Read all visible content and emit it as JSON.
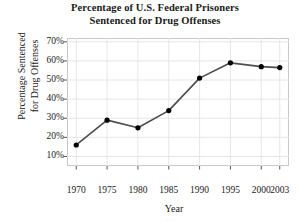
{
  "chart_data": {
    "type": "line",
    "title": "Percentage of U.S. Federal Prisoners Sentenced for Drug Offenses",
    "title_lines": [
      "Percentage of U.S. Federal Prisoners",
      "Sentenced for Drug Offenses"
    ],
    "xlabel": "Year",
    "ylabel": "Percentage Sentenced for Drug Offenses",
    "ylabel_lines": [
      "Percentage Sentenced",
      "for Drug Offenses"
    ],
    "x": [
      1970,
      1975,
      1980,
      1985,
      1990,
      1995,
      2000,
      2003
    ],
    "values": [
      16,
      29,
      25,
      34,
      51,
      59,
      57,
      56.5
    ],
    "xtick_labels": [
      "1970",
      "1975",
      "1980",
      "1985",
      "1990",
      "1995",
      "2000",
      "2003"
    ],
    "ytick_labels": [
      "10%",
      "20%",
      "30%",
      "40%",
      "50%",
      "60%",
      "70%"
    ],
    "ytick_values": [
      10,
      20,
      30,
      40,
      50,
      60,
      70
    ],
    "ylim": [
      5,
      72
    ],
    "xlim": [
      1968.5,
      2004.5
    ],
    "grid": true,
    "legend": null,
    "line_color": "#4d4d4d",
    "marker_color": "#000000",
    "grid_color": "#e6e6e6",
    "axis_color": "#c9c9c9",
    "background_color": "#ffffff"
  }
}
